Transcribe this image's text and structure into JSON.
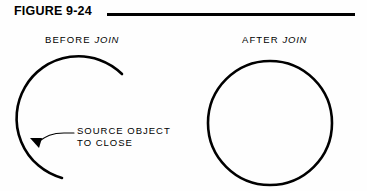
{
  "figure": {
    "title": "FIGURE 9-24",
    "background_color": "#fefefe",
    "ink_color": "#000000"
  },
  "panels": {
    "before": {
      "caption_prefix": "BEFORE",
      "caption_keyword": "JOIN",
      "shape": "open-arc",
      "annotation_line_1": "SOURCE  OBJECT",
      "annotation_line_2": "TO  CLOSE"
    },
    "after": {
      "caption_prefix": "AFTER",
      "caption_keyword": "JOIN",
      "shape": "closed-circle"
    }
  }
}
